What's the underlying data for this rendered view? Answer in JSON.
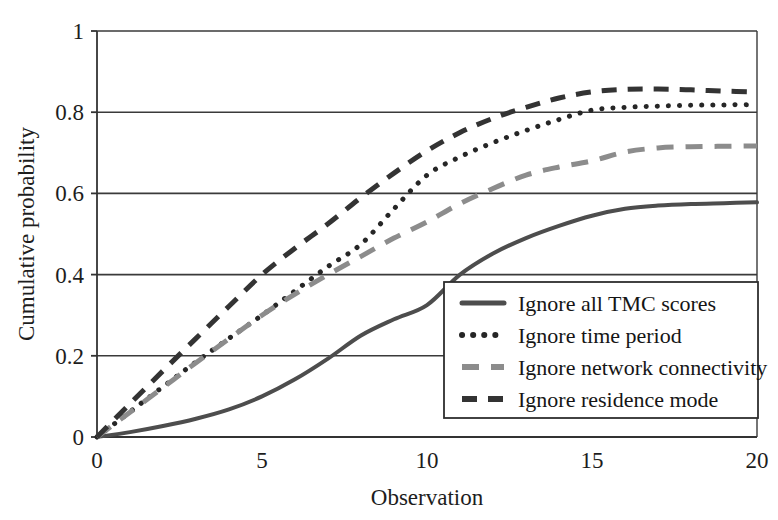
{
  "chart_data": {
    "type": "line",
    "title": "",
    "xlabel": "Observation",
    "ylabel": "Cumulative probability",
    "xlim": [
      0,
      20
    ],
    "ylim": [
      0,
      1
    ],
    "xticks": [
      "0",
      "5",
      "10",
      "15",
      "20"
    ],
    "xtick_values": [
      0,
      5,
      10,
      15,
      20
    ],
    "yticks": [
      "0",
      "0.2",
      "0.4",
      "0.6",
      "0.8",
      "1"
    ],
    "ytick_values": [
      0,
      0.2,
      0.4,
      0.6,
      0.8,
      1
    ],
    "grid": "horizontal",
    "legend_position": "inner-lower-right",
    "x": [
      0,
      1,
      2,
      3,
      4,
      5,
      6,
      7,
      8,
      9,
      10,
      11,
      12,
      13,
      14,
      15,
      16,
      17,
      18,
      19,
      20
    ],
    "series": [
      {
        "name": "Ignore all TMC scores",
        "style": "solid",
        "color": "#4d4d4d",
        "width": 4,
        "values": [
          0,
          0.012,
          0.027,
          0.045,
          0.068,
          0.1,
          0.142,
          0.193,
          0.25,
          0.29,
          0.325,
          0.4,
          0.452,
          0.49,
          0.52,
          0.545,
          0.562,
          0.57,
          0.574,
          0.576,
          0.578
        ]
      },
      {
        "name": "Ignore time period",
        "style": "dotted",
        "color": "#262626",
        "width": 5,
        "values": [
          0,
          0.062,
          0.124,
          0.185,
          0.243,
          0.3,
          0.36,
          0.42,
          0.475,
          0.562,
          0.645,
          0.69,
          0.725,
          0.755,
          0.782,
          0.805,
          0.812,
          0.815,
          0.817,
          0.818,
          0.818
        ]
      },
      {
        "name": "Ignore network connectivity",
        "style": "dashed-light",
        "color": "#8c8c8c",
        "width": 5,
        "values": [
          0,
          0.061,
          0.122,
          0.183,
          0.242,
          0.3,
          0.352,
          0.4,
          0.445,
          0.49,
          0.53,
          0.575,
          0.612,
          0.645,
          0.665,
          0.68,
          0.702,
          0.712,
          0.715,
          0.716,
          0.717
        ]
      },
      {
        "name": "Ignore residence mode",
        "style": "dashed-dark",
        "color": "#333333",
        "width": 5,
        "values": [
          0,
          0.082,
          0.163,
          0.243,
          0.322,
          0.4,
          0.465,
          0.525,
          0.59,
          0.65,
          0.705,
          0.75,
          0.785,
          0.812,
          0.835,
          0.85,
          0.856,
          0.857,
          0.855,
          0.852,
          0.85
        ]
      }
    ]
  },
  "legend": {
    "items": [
      {
        "label": "Ignore all TMC scores"
      },
      {
        "label": "Ignore time period"
      },
      {
        "label": "Ignore network connectivity"
      },
      {
        "label": "Ignore residence mode"
      }
    ]
  },
  "caption": {
    "fragment": ""
  },
  "colors": {
    "axis": "#333333",
    "grid": "#3a3a3a",
    "background": "#ffffff",
    "series_solid": "#4d4d4d",
    "series_dotted": "#262626",
    "series_light_dashed": "#8c8c8c",
    "series_dark_dashed": "#333333"
  }
}
